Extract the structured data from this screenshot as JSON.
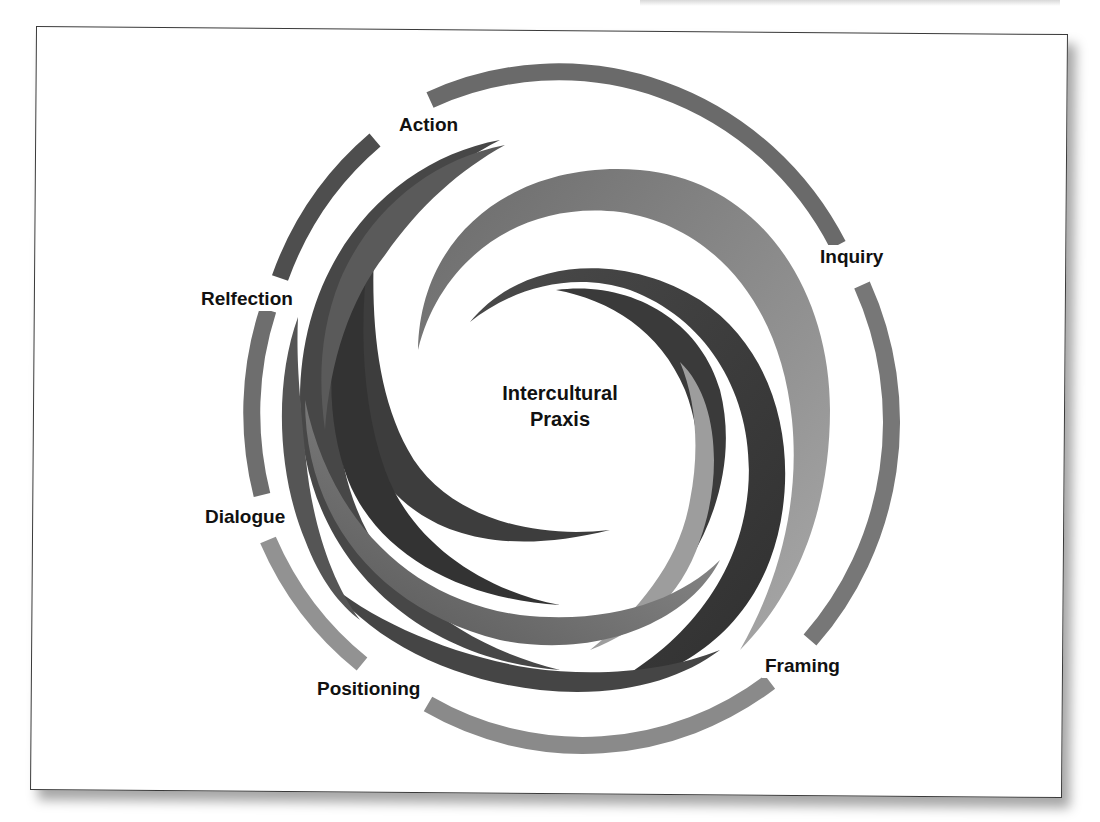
{
  "diagram": {
    "title": "Intercultural Praxis",
    "center": {
      "line1": "Intercultural",
      "line2": "Praxis"
    },
    "labels": [
      {
        "id": "action",
        "text": "Action",
        "x": 396,
        "y": 113
      },
      {
        "id": "inquiry",
        "text": "Inquiry",
        "x": 820,
        "y": 245
      },
      {
        "id": "framing",
        "text": "Framing",
        "x": 762,
        "y": 654
      },
      {
        "id": "positioning",
        "text": "Positioning",
        "x": 330,
        "y": 677
      },
      {
        "id": "dialogue",
        "text": "Dialogue",
        "x": 202,
        "y": 505
      },
      {
        "id": "reflection",
        "text": "Relfection",
        "x": 198,
        "y": 287
      }
    ],
    "colors": {
      "frame_border": "#3a3a3a",
      "arm_dark": "#3c3c3c",
      "arm_mid": "#5e5e5e",
      "arm_light": "#8c8c8c",
      "arm_lighter": "#a8a8a8",
      "text": "#111111"
    },
    "style": "grayscale clockwise swirl of crescent arms within a circular outer ring"
  }
}
